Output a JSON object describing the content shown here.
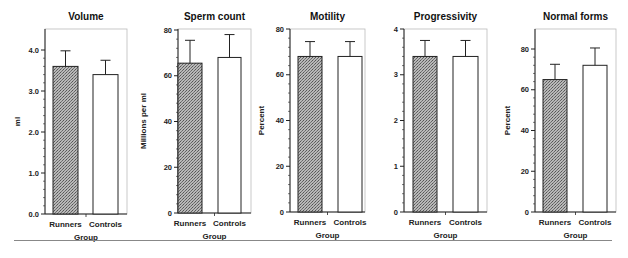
{
  "chart_data": [
    {
      "type": "bar",
      "title": "Volume",
      "xlabel": "Group",
      "ylabel": "ml",
      "categories": [
        "Runners",
        "Controls"
      ],
      "values": [
        3.6,
        3.4
      ],
      "error_upper": [
        3.98,
        3.75
      ],
      "ylim": [
        0,
        4.5
      ],
      "yticks": [
        0.0,
        1.0,
        2.0,
        3.0,
        4.0
      ],
      "ytick_labels": [
        "0.0",
        "1.0",
        "2.0",
        "3.0",
        "4.0"
      ],
      "grid": false
    },
    {
      "type": "bar",
      "title": "Sperm  count",
      "xlabel": "Group",
      "ylabel": "Millions per ml",
      "categories": [
        "Runners",
        "Controls"
      ],
      "values": [
        65.5,
        68
      ],
      "error_upper": [
        75.5,
        78
      ],
      "ylim": [
        0,
        80
      ],
      "yticks": [
        0,
        20,
        40,
        60,
        80
      ],
      "ytick_labels": [
        "0",
        "20",
        "40",
        "60",
        "80"
      ],
      "grid": false
    },
    {
      "type": "bar",
      "title": "Motility",
      "xlabel": "Group",
      "ylabel": "Percent",
      "categories": [
        "Runners",
        "Controls"
      ],
      "values": [
        68,
        68
      ],
      "error_upper": [
        74.5,
        74.5
      ],
      "ylim": [
        0,
        80
      ],
      "yticks": [
        0,
        20,
        40,
        60,
        80
      ],
      "ytick_labels": [
        "0",
        "20",
        "40",
        "60",
        "80"
      ],
      "grid": false
    },
    {
      "type": "bar",
      "title": "Progressivity",
      "xlabel": "Group",
      "ylabel": "",
      "categories": [
        "Runners",
        "Controls"
      ],
      "values": [
        3.4,
        3.4
      ],
      "error_upper": [
        3.75,
        3.75
      ],
      "ylim": [
        0,
        4
      ],
      "yticks": [
        0,
        1,
        2,
        3,
        4
      ],
      "ytick_labels": [
        "0",
        "1",
        "2",
        "3",
        "4"
      ],
      "grid": false
    },
    {
      "type": "bar",
      "title": "Normal  forms",
      "xlabel": "Group",
      "ylabel": "Percent",
      "categories": [
        "Runners",
        "Controls"
      ],
      "values": [
        65,
        72
      ],
      "error_upper": [
        72.5,
        80.5
      ],
      "ylim": [
        0,
        90
      ],
      "yticks": [
        0,
        20,
        40,
        60,
        80
      ],
      "ytick_labels": [
        "0",
        "20",
        "40",
        "60",
        "80"
      ],
      "grid": false
    }
  ],
  "style": {
    "runners_fill": "#9a9a9a",
    "controls_fill": "#ffffff",
    "stroke": "#222222"
  },
  "layout": [
    {
      "ax_left": 45,
      "ax_right": 127,
      "ax_top": 29,
      "ax_bottom": 214,
      "ymax_px_value": 4.0,
      "ymax_px": 50,
      "bars": [
        [
          53,
          78
        ],
        [
          93,
          118
        ]
      ],
      "ylabel_x": 14
    },
    {
      "ax_left": 178,
      "ax_right": 251,
      "ax_top": 29,
      "ax_bottom": 213,
      "ymax_px_value": 80,
      "ymax_px": 30,
      "bars": [
        [
          178,
          202
        ],
        [
          218,
          241
        ]
      ],
      "ylabel_x": 140
    },
    {
      "ax_left": 290,
      "ax_right": 365,
      "ax_top": 29,
      "ax_bottom": 212,
      "ymax_px_value": 80,
      "ymax_px": 29,
      "bars": [
        [
          298,
          322
        ],
        [
          338,
          362
        ]
      ],
      "ylabel_x": 258
    },
    {
      "ax_left": 404,
      "ax_right": 487,
      "ax_top": 29,
      "ax_bottom": 212,
      "ymax_px_value": 4,
      "ymax_px": 29,
      "bars": [
        [
          413,
          437
        ],
        [
          453,
          478
        ]
      ],
      "ylabel_x": 0
    },
    {
      "ax_left": 535,
      "ax_right": 616,
      "ax_top": 29,
      "ax_bottom": 212,
      "ymax_px_value": 80,
      "ymax_px": 49,
      "bars": [
        [
          543,
          567
        ],
        [
          583,
          607
        ]
      ],
      "ylabel_x": 504
    }
  ]
}
